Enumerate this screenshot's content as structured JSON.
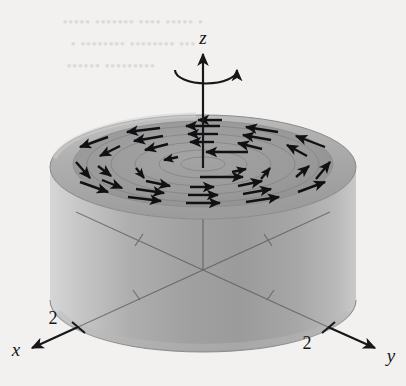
{
  "figure": {
    "background_color": "#f2f1ef"
  },
  "axes": {
    "z": {
      "label": "z",
      "direction": "up"
    },
    "x": {
      "label": "x",
      "direction": "down-left",
      "tick_label": "2"
    },
    "y": {
      "label": "y",
      "direction": "down-right",
      "tick_label": "2"
    },
    "line_color": "#17171a"
  },
  "rotation_indicator": {
    "name": "rotation-arrow",
    "sense": "counterclockwise",
    "color": "#17171a"
  },
  "cylinder": {
    "radius_value": 2,
    "top_face_color": "#9b9b9b",
    "top_rim_color": "#8a8a8a",
    "top_highlight_color": "#c2c2c2",
    "side_light_color": "#cfcfcf",
    "side_mid_color": "#a8a8a8",
    "side_dark_color": "#969696",
    "edge_color": "#8f8f8f"
  },
  "vector_field": {
    "name": "circulation-field",
    "sense": "counterclockwise",
    "arrow_color": "#111114",
    "streamline_color": "#858585",
    "ring_count": 5,
    "arrow_count": 28
  },
  "bleed_through": {
    "line1": "• ••••• •••• ••••••• •••••",
    "line2": "••• •••••••• •••••••• •",
    "line3": "••••••••• ••••••"
  }
}
